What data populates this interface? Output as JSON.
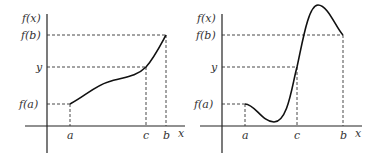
{
  "panels": [
    {
      "name": "monotonic",
      "y_axis_label": "f(x)",
      "x_axis_label": "x",
      "y_ticks": {
        "fb": "f(b)",
        "y": "y",
        "fa": "f(a)"
      },
      "x_ticks": {
        "a": "a",
        "c": "c",
        "b": "b"
      }
    },
    {
      "name": "non-monotonic",
      "y_axis_label": "f(x)",
      "x_axis_label": "x",
      "y_ticks": {
        "fb": "f(b)",
        "y": "y",
        "fa": "f(a)"
      },
      "x_ticks": {
        "a": "a",
        "c": "c",
        "b": "b"
      }
    }
  ],
  "colors": {
    "ink": "#222222",
    "background": "#ffffff"
  }
}
